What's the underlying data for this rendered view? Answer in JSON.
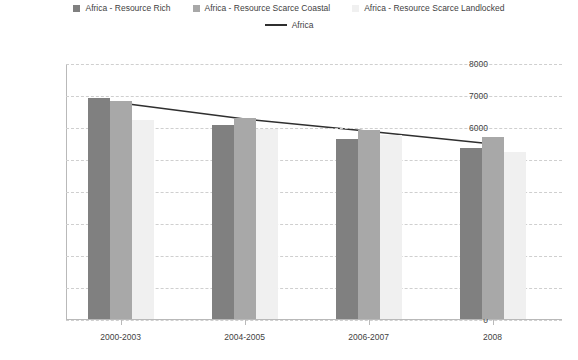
{
  "chart_data": {
    "type": "bar",
    "title": "",
    "xlabel": "",
    "ylabel": "",
    "ylim": [
      0,
      8000
    ],
    "ytick_step": 1000,
    "grid": true,
    "legend_position": "top",
    "categories": [
      "2000-2003",
      "2004-2005",
      "2006-2007",
      "2008"
    ],
    "ytick_labels": [
      "8000",
      "7000",
      "6000",
      "5000",
      "4000",
      "3000",
      "2000",
      "1000",
      "0"
    ],
    "series": [
      {
        "name": "Africa - Resource Rich",
        "type": "bar",
        "color": "#808080",
        "values": [
          6950,
          6100,
          5650,
          5380
        ]
      },
      {
        "name": "Africa - Resource Scarce Coastal",
        "type": "bar",
        "color": "#a8a8a8",
        "values": [
          6840,
          6300,
          5930,
          5720
        ]
      },
      {
        "name": "Africa - Resource Scarce Landlocked",
        "type": "bar",
        "color": "#f0f0f0",
        "values": [
          6250,
          5970,
          5780,
          5250
        ]
      },
      {
        "name": "Africa",
        "type": "line",
        "color": "#2f2f2f",
        "values": [
          6780,
          6280,
          5900,
          5500
        ]
      }
    ]
  },
  "legend": {
    "items": [
      {
        "label": "Africa - Resource Rich",
        "marker": "square-swatch",
        "color": "#808080"
      },
      {
        "label": "Africa - Resource Scarce Coastal",
        "marker": "square-swatch",
        "color": "#a8a8a8"
      },
      {
        "label": "Africa - Resource Scarce Landlocked",
        "marker": "square-swatch",
        "color": "#f0f0f0"
      },
      {
        "label": "Africa",
        "marker": "line-swatch",
        "color": "#2f2f2f"
      }
    ]
  }
}
